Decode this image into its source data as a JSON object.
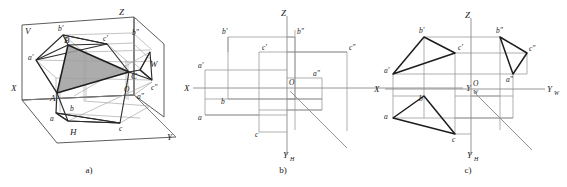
{
  "figure": {
    "captions": {
      "a": "a)",
      "b": "b)",
      "c": "c)"
    },
    "colors": {
      "ink": "#1d1d1d",
      "construction": "#8d8d8d",
      "axis": "#8a8a8a",
      "shade_fill": "#9d9d9d",
      "background": "#ffffff"
    }
  },
  "panel_a": {
    "caption": "a)",
    "plane_labels": {
      "v": "V",
      "h": "H",
      "w": "W"
    },
    "axis_labels": {
      "x": "X",
      "y": "Y",
      "z": "Z"
    },
    "space_points": {
      "A": "A",
      "B": "B",
      "C": "C"
    },
    "front_view_points": {
      "a": "a'",
      "b": "b'",
      "c": "c'"
    },
    "top_view_points": {
      "a": "a",
      "b": "b",
      "c": "c"
    },
    "side_view_points": {
      "a": "a\"",
      "b": "b\"",
      "c": "c\""
    },
    "origin": "O",
    "shaded_triangle": "ABC"
  },
  "panel_b": {
    "caption": "b)",
    "axis_labels": {
      "x": "X",
      "z": "Z",
      "yw": "Y",
      "yw_sub": "W",
      "yh": "Y",
      "yh_sub": "H"
    },
    "origin": "O",
    "front_view_points": {
      "a": "a'",
      "b": "b'",
      "c": "c'"
    },
    "top_view_points": {
      "a": "a",
      "b": "b",
      "c": "c"
    },
    "side_view_points": {
      "a": "a\"",
      "b": "b\"",
      "c": "c\""
    }
  },
  "panel_c": {
    "caption": "c)",
    "axis_labels": {
      "x": "X",
      "z": "Z",
      "yw": "Y",
      "yw_sub": "W",
      "yh": "Y",
      "yh_sub": "H"
    },
    "origin": "O",
    "front_view_points": {
      "a": "a'",
      "b": "b'",
      "c": "c'"
    },
    "top_view_points": {
      "a": "a",
      "b": "b",
      "c": "c"
    },
    "side_view_points": {
      "a": "a\"",
      "b": "b\"",
      "c": "c\""
    }
  }
}
